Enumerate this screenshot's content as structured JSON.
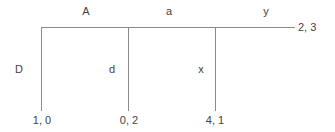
{
  "diagram": {
    "type": "extensive-form-game-tree",
    "line_color": "#8a8a8a",
    "text_color": "#444444",
    "continue_actions": [
      {
        "label": "A"
      },
      {
        "label": "a"
      },
      {
        "label": "y"
      }
    ],
    "stop_actions": [
      {
        "label": "D"
      },
      {
        "label": "d"
      },
      {
        "label": "x"
      }
    ],
    "terminal_payoffs": [
      {
        "label": "1, 0"
      },
      {
        "label": "0, 2"
      },
      {
        "label": "4, 1"
      }
    ],
    "final_payoff": {
      "label": "2, 3"
    }
  }
}
